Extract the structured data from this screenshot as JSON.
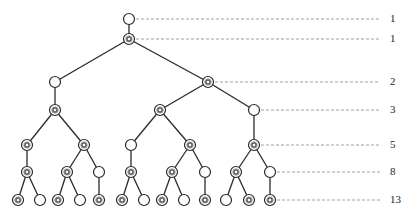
{
  "legend": {
    "open_node": "young pair (open circle)",
    "double_node": "mature pair (double circle)"
  },
  "rows": [
    {
      "level": 0,
      "y": 19,
      "count_label": "1"
    },
    {
      "level": 1,
      "y": 39,
      "count_label": "1"
    },
    {
      "level": 2,
      "y": 82,
      "count_label": "2"
    },
    {
      "level": 3,
      "y": 110,
      "count_label": "3"
    },
    {
      "level": 4,
      "y": 145,
      "count_label": "5"
    },
    {
      "level": 5,
      "y": 172,
      "count_label": "8"
    },
    {
      "level": 6,
      "y": 200,
      "count_label": "13"
    }
  ],
  "dash_line": {
    "end_x": 380,
    "label_x": 390
  },
  "nodes": [
    {
      "id": "n0",
      "x": 129,
      "y": 19,
      "type": "open",
      "parent": null
    },
    {
      "id": "n1",
      "x": 129,
      "y": 39,
      "type": "double",
      "parent": "n0"
    },
    {
      "id": "n2",
      "x": 55,
      "y": 82,
      "type": "open",
      "parent": "n1"
    },
    {
      "id": "n3",
      "x": 208,
      "y": 82,
      "type": "double",
      "parent": "n1"
    },
    {
      "id": "n4",
      "x": 55,
      "y": 110,
      "type": "double",
      "parent": "n2"
    },
    {
      "id": "n5",
      "x": 160,
      "y": 110,
      "type": "double",
      "parent": "n3"
    },
    {
      "id": "n6",
      "x": 254,
      "y": 110,
      "type": "open",
      "parent": "n3"
    },
    {
      "id": "n7",
      "x": 27,
      "y": 145,
      "type": "double",
      "parent": "n4"
    },
    {
      "id": "n8",
      "x": 84,
      "y": 145,
      "type": "double",
      "parent": "n4"
    },
    {
      "id": "n9",
      "x": 131,
      "y": 145,
      "type": "open",
      "parent": "n5"
    },
    {
      "id": "n10",
      "x": 190,
      "y": 145,
      "type": "double",
      "parent": "n5"
    },
    {
      "id": "n11",
      "x": 254,
      "y": 145,
      "type": "double",
      "parent": "n6"
    },
    {
      "id": "n12",
      "x": 27,
      "y": 172,
      "type": "double",
      "parent": "n7"
    },
    {
      "id": "n13",
      "x": 67,
      "y": 172,
      "type": "double",
      "parent": "n8"
    },
    {
      "id": "n14",
      "x": 99,
      "y": 172,
      "type": "open",
      "parent": "n8"
    },
    {
      "id": "n15",
      "x": 131,
      "y": 172,
      "type": "double",
      "parent": "n9"
    },
    {
      "id": "n16",
      "x": 172,
      "y": 172,
      "type": "double",
      "parent": "n10"
    },
    {
      "id": "n17",
      "x": 205,
      "y": 172,
      "type": "open",
      "parent": "n10"
    },
    {
      "id": "n18",
      "x": 236,
      "y": 172,
      "type": "double",
      "parent": "n11"
    },
    {
      "id": "n19",
      "x": 270,
      "y": 172,
      "type": "open",
      "parent": "n11"
    },
    {
      "id": "n20",
      "x": 18,
      "y": 200,
      "type": "double",
      "parent": "n12"
    },
    {
      "id": "n21",
      "x": 40,
      "y": 200,
      "type": "open",
      "parent": "n12"
    },
    {
      "id": "n22",
      "x": 58,
      "y": 200,
      "type": "double",
      "parent": "n13"
    },
    {
      "id": "n23",
      "x": 80,
      "y": 200,
      "type": "open",
      "parent": "n13"
    },
    {
      "id": "n24",
      "x": 99,
      "y": 200,
      "type": "double",
      "parent": "n14"
    },
    {
      "id": "n25",
      "x": 122,
      "y": 200,
      "type": "double",
      "parent": "n15"
    },
    {
      "id": "n26",
      "x": 144,
      "y": 200,
      "type": "open",
      "parent": "n15"
    },
    {
      "id": "n27",
      "x": 162,
      "y": 200,
      "type": "double",
      "parent": "n16"
    },
    {
      "id": "n28",
      "x": 184,
      "y": 200,
      "type": "open",
      "parent": "n16"
    },
    {
      "id": "n29",
      "x": 205,
      "y": 200,
      "type": "double",
      "parent": "n17"
    },
    {
      "id": "n30",
      "x": 226,
      "y": 200,
      "type": "open",
      "parent": "n18"
    },
    {
      "id": "n31",
      "x": 249,
      "y": 200,
      "type": "double",
      "parent": "n18"
    },
    {
      "id": "n32",
      "x": 270,
      "y": 200,
      "type": "double",
      "parent": "n19"
    }
  ],
  "dash_from": {
    "0": 136,
    "1": 136,
    "2": 215,
    "3": 261,
    "4": 261,
    "5": 277,
    "6": 277
  },
  "colors": {
    "line": "#2a2a2a",
    "dash": "#888888",
    "node_stroke": "#2a2a2a",
    "node_fill": "#ffffff",
    "inner_fill": "#9a9a9a",
    "label": "#222222"
  }
}
